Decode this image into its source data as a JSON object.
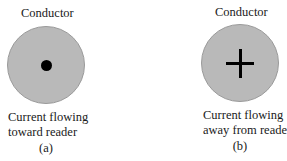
{
  "figure_a": {
    "title": "Conductor",
    "symbol": "dot",
    "caption_line1": "Current flowing",
    "caption_line2": "toward reader",
    "sublabel": "(a)"
  },
  "figure_b": {
    "title": "Conductor",
    "symbol": "cross",
    "caption_line1": "Current flowing",
    "caption_line2": "away from reader",
    "sublabel": "(b)"
  },
  "colors": {
    "conductor_fill": "#b9b9b9",
    "symbol": "#000000"
  }
}
